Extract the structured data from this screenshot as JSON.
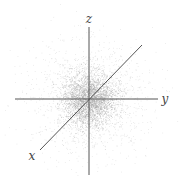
{
  "diagram": {
    "title": "",
    "origin": [
      89,
      99
    ],
    "colors": {
      "axis": "#555555",
      "points": "#9a9a9a",
      "label": "#444444",
      "background": "#ffffff"
    },
    "axes": [
      {
        "name": "z",
        "label": "z",
        "from": [
          89,
          175
        ],
        "to": [
          89,
          27
        ],
        "label_pos": [
          89,
          23
        ]
      },
      {
        "name": "y",
        "label": "y",
        "from": [
          15,
          99
        ],
        "to": [
          158,
          99
        ],
        "label_pos": [
          165,
          103
        ]
      },
      {
        "name": "x",
        "label": "x",
        "from": [
          142,
          45
        ],
        "to": [
          40,
          150
        ],
        "label_pos": [
          32,
          160
        ]
      }
    ],
    "cloud": {
      "distribution": "gaussian",
      "core_sigma": 13,
      "halo_sigma": 28,
      "core_count": 2600,
      "halo_count": 1600,
      "dot_size": 0.7
    }
  }
}
